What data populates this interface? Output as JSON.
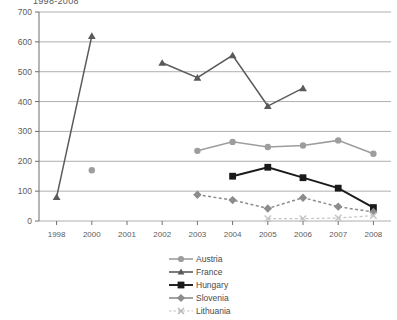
{
  "chart_data": {
    "type": "line",
    "title": "1998-2008",
    "xlabel": "",
    "ylabel": "",
    "ylim": [
      0,
      700
    ],
    "ytick_step": 100,
    "yticks": [
      "0",
      "100",
      "200",
      "300",
      "400",
      "500",
      "600",
      "700"
    ],
    "grid": true,
    "legend_position": "bottom-center",
    "categories": [
      "1998",
      "2000",
      "2001",
      "2002",
      "2003",
      "2004",
      "2005",
      "2006",
      "2007",
      "2008"
    ],
    "series": [
      {
        "name": "Austria",
        "color": "#9d9d9d",
        "marker": "circle",
        "line_style": "solid",
        "values": [
          null,
          170,
          null,
          null,
          235,
          265,
          248,
          253,
          270,
          225
        ]
      },
      {
        "name": "France",
        "color": "#5a5a5a",
        "marker": "triangle",
        "line_style": "solid",
        "values": [
          80,
          620,
          null,
          530,
          480,
          555,
          385,
          445,
          null,
          null
        ]
      },
      {
        "name": "Hungary",
        "color": "#1a1a1a",
        "marker": "square",
        "line_style": "solid",
        "values": [
          null,
          null,
          null,
          null,
          null,
          150,
          180,
          145,
          110,
          45
        ]
      },
      {
        "name": "Slovenia",
        "color": "#8c8c8c",
        "marker": "diamond",
        "line_style": "dashed",
        "values": [
          null,
          null,
          null,
          null,
          88,
          70,
          42,
          78,
          48,
          30
        ]
      },
      {
        "name": "Lithuania",
        "color": "#c4c4c4",
        "marker": "x",
        "line_style": "dashed",
        "values": [
          null,
          null,
          null,
          null,
          null,
          null,
          8,
          8,
          10,
          18
        ]
      }
    ]
  },
  "legend": {
    "items": [
      {
        "label": "Austria"
      },
      {
        "label": "France"
      },
      {
        "label": "Hungary"
      },
      {
        "label": "Slovenia"
      },
      {
        "label": "Lithuania"
      }
    ]
  }
}
